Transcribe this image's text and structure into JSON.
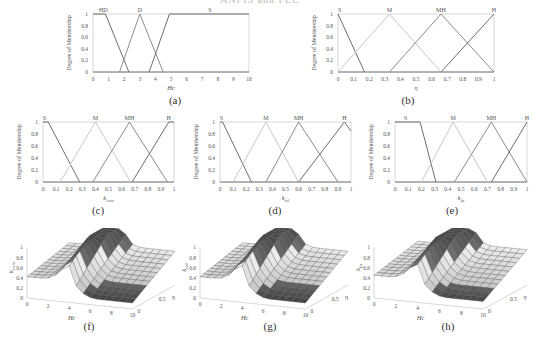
{
  "header": {
    "title": "ANFIS and FLC"
  },
  "colors": {
    "line_dark": "#6e6e6e",
    "line_mid": "#8c8c8c",
    "line_light": "#c8c8c8",
    "axis": "#bdbdbd",
    "text": "#555555"
  },
  "chart_data": [
    {
      "id": "a",
      "caption": "(a)",
      "type": "line",
      "title": "",
      "xlabel": "Hc",
      "ylabel": "Degree of Membership",
      "xlim": [
        0,
        10
      ],
      "ylim": [
        0,
        1
      ],
      "xticks": [
        "0",
        "1",
        "2",
        "3",
        "4",
        "5",
        "6",
        "7",
        "8",
        "9",
        "10"
      ],
      "yticks": [
        "0",
        "0.2",
        "0.4",
        "0.6",
        "0.8",
        "1"
      ],
      "series": [
        {
          "name": "HD",
          "x": [
            0,
            0.8,
            2.3
          ],
          "y": [
            1,
            1,
            0
          ]
        },
        {
          "name": "D",
          "x": [
            1.7,
            3,
            4.5
          ],
          "y": [
            0,
            1,
            0
          ]
        },
        {
          "name": "S",
          "x": [
            3.6,
            4.9,
            10
          ],
          "y": [
            0,
            1,
            1
          ]
        }
      ]
    },
    {
      "id": "b",
      "caption": "(b)",
      "type": "line",
      "title": "",
      "xlabel": "η",
      "ylabel": "Degree of Membership",
      "xlim": [
        0,
        1
      ],
      "ylim": [
        0,
        1
      ],
      "xticks": [
        "0",
        "0.1",
        "0.2",
        "0.3",
        "0.4",
        "0.5",
        "0.6",
        "0.7",
        "0.8",
        "0.9",
        "1"
      ],
      "yticks": [
        "0",
        "0.2",
        "0.4",
        "0.6",
        "0.8",
        "1"
      ],
      "series": [
        {
          "name": "S",
          "x": [
            0,
            0.17
          ],
          "y": [
            1,
            0
          ]
        },
        {
          "name": "M",
          "x": [
            0,
            0.33,
            0.66
          ],
          "y": [
            0,
            1,
            0
          ]
        },
        {
          "name": "MH",
          "x": [
            0.33,
            0.66,
            1
          ],
          "y": [
            0,
            1,
            0
          ]
        },
        {
          "name": "H",
          "x": [
            0.66,
            1
          ],
          "y": [
            0,
            1
          ]
        }
      ]
    },
    {
      "id": "c",
      "caption": "(c)",
      "type": "line",
      "title": "",
      "xlabel": "k_com",
      "ylabel": "Degree of Membership",
      "xlim": [
        0,
        1
      ],
      "ylim": [
        0,
        1
      ],
      "xticks": [
        "0",
        "0.1",
        "0.2",
        "0.3",
        "0.4",
        "0.5",
        "0.6",
        "0.7",
        "0.8",
        "0.9",
        "1"
      ],
      "yticks": [
        "0",
        "0.2",
        "0.4",
        "0.6",
        "0.8",
        "1"
      ],
      "series": [
        {
          "name": "S",
          "x": [
            0,
            0.04,
            0.28
          ],
          "y": [
            1,
            1,
            0
          ]
        },
        {
          "name": "M",
          "x": [
            0.13,
            0.4,
            0.67
          ],
          "y": [
            0,
            1,
            0
          ]
        },
        {
          "name": "MH",
          "x": [
            0.38,
            0.66,
            0.95
          ],
          "y": [
            0,
            1,
            0
          ]
        },
        {
          "name": "H",
          "x": [
            0.68,
            0.96,
            1
          ],
          "y": [
            0,
            1,
            1
          ]
        }
      ]
    },
    {
      "id": "d",
      "caption": "(d)",
      "type": "line",
      "title": "",
      "xlabel": "k_tol",
      "ylabel": "Degree of Membership",
      "xlim": [
        0,
        1
      ],
      "ylim": [
        0,
        1
      ],
      "xticks": [
        "0",
        "0.1",
        "0.2",
        "0.3",
        "0.4",
        "0.5",
        "0.6",
        "0.7",
        "0.8",
        "0.9",
        "1"
      ],
      "yticks": [
        "0",
        "0.2",
        "0.4",
        "0.6",
        "0.8",
        "1"
      ],
      "series": [
        {
          "name": "S",
          "x": [
            0,
            0.02,
            0.24
          ],
          "y": [
            1,
            1,
            0
          ]
        },
        {
          "name": "M",
          "x": [
            0.1,
            0.35,
            0.6
          ],
          "y": [
            0,
            1,
            0
          ]
        },
        {
          "name": "MH",
          "x": [
            0.35,
            0.6,
            0.9
          ],
          "y": [
            0,
            1,
            0
          ]
        },
        {
          "name": "H",
          "x": [
            0.6,
            0.95,
            1
          ],
          "y": [
            0,
            1,
            0.85
          ]
        }
      ]
    },
    {
      "id": "e",
      "caption": "(e)",
      "type": "line",
      "title": "",
      "xlabel": "k_fa",
      "ylabel": "Degree of Membership",
      "xlim": [
        0,
        1
      ],
      "ylim": [
        0,
        1
      ],
      "xticks": [
        "0",
        "0.1",
        "0.2",
        "0.3",
        "0.4",
        "0.5",
        "0.6",
        "0.7",
        "0.8",
        "0.9",
        "1"
      ],
      "yticks": [
        "0",
        "0.2",
        "0.4",
        "0.6",
        "0.8",
        "1"
      ],
      "series": [
        {
          "name": "S",
          "x": [
            0,
            0.19,
            0.31
          ],
          "y": [
            1,
            1,
            0
          ]
        },
        {
          "name": "M",
          "x": [
            0.2,
            0.44,
            0.7
          ],
          "y": [
            0,
            1,
            0
          ]
        },
        {
          "name": "MH",
          "x": [
            0.45,
            0.73,
            1
          ],
          "y": [
            0,
            1,
            0
          ]
        },
        {
          "name": "H",
          "x": [
            0.73,
            1
          ],
          "y": [
            0,
            1
          ]
        }
      ]
    },
    {
      "id": "f",
      "caption": "(f)",
      "type": "surface",
      "title": "",
      "xlabel": "Hc",
      "ylabel": "η",
      "zlabel": "k_com",
      "xticks": [
        "0",
        "2",
        "4",
        "6",
        "8",
        "10"
      ],
      "yticks": [
        "0",
        "0.5",
        "1"
      ],
      "zticks": [
        "0",
        "0.2",
        "0.4",
        "0.6",
        "0.8",
        "1"
      ]
    },
    {
      "id": "g",
      "caption": "(g)",
      "type": "surface",
      "title": "",
      "xlabel": "Hc",
      "ylabel": "η",
      "zlabel": "k_tol",
      "xticks": [
        "0",
        "2",
        "4",
        "6",
        "8",
        "10"
      ],
      "yticks": [
        "0",
        "0.5",
        "1"
      ],
      "zticks": [
        "0",
        "0.2",
        "0.4",
        "0.6",
        "0.8",
        "1"
      ]
    },
    {
      "id": "h",
      "caption": "(h)",
      "type": "surface",
      "title": "",
      "xlabel": "Hc",
      "ylabel": "η",
      "zlabel": "k_fa",
      "xticks": [
        "0",
        "2",
        "4",
        "6",
        "8",
        "10"
      ],
      "yticks": [
        "0",
        "0.5",
        "1"
      ],
      "zticks": [
        "0",
        "0.2",
        "0.4",
        "0.6",
        "0.8",
        "1"
      ]
    }
  ]
}
